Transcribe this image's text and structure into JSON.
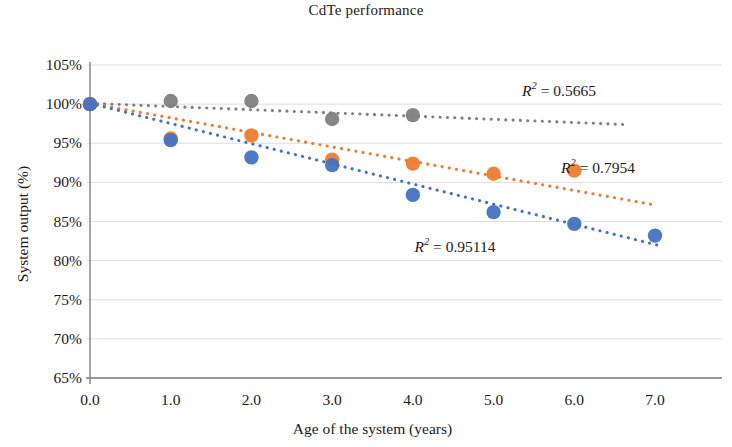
{
  "chart_data": {
    "type": "scatter",
    "title": "CdTe performance",
    "xlabel": "Age of the system (years)",
    "ylabel": "System output (%)",
    "xlim": [
      0.0,
      7.0
    ],
    "ylim": [
      65,
      105
    ],
    "xticks": [
      "0.0",
      "1.0",
      "2.0",
      "3.0",
      "4.0",
      "5.0",
      "6.0",
      "7.0"
    ],
    "xtick_values": [
      0,
      1,
      2,
      3,
      4,
      5,
      6,
      7
    ],
    "yticks": [
      "65%",
      "70%",
      "75%",
      "80%",
      "85%",
      "90%",
      "95%",
      "100%",
      "105%"
    ],
    "ytick_values": [
      65,
      70,
      75,
      80,
      85,
      90,
      95,
      100,
      105
    ],
    "grid": "horizontal",
    "legend": "none",
    "series": [
      {
        "name": "gray-series",
        "color": "#808080",
        "marker": "circle",
        "x": [
          0.0,
          1.0,
          2.0,
          3.0,
          4.0
        ],
        "y": [
          100.0,
          100.4,
          100.4,
          98.1,
          98.6
        ],
        "trendline": {
          "style": "dotted",
          "x_start": 0.0,
          "y_start": 100.1,
          "x_end": 6.6,
          "y_end": 97.4,
          "r2_label": "0.5665"
        }
      },
      {
        "name": "orange-series",
        "color": "#ED7D31",
        "marker": "circle",
        "x": [
          0.0,
          1.0,
          2.0,
          3.0,
          4.0,
          5.0,
          6.0
        ],
        "y": [
          100.0,
          95.6,
          96.0,
          92.9,
          92.4,
          91.1,
          91.5
        ],
        "trendline": {
          "style": "dotted",
          "x_start": 0.0,
          "y_start": 100.1,
          "x_end": 6.95,
          "y_end": 87.2,
          "r2_label": "0.7954"
        }
      },
      {
        "name": "blue-series",
        "color": "#4472C4",
        "marker": "circle",
        "x": [
          0.0,
          1.0,
          2.0,
          3.0,
          4.0,
          5.0,
          6.0,
          7.0
        ],
        "y": [
          100.0,
          95.4,
          93.2,
          92.2,
          88.4,
          86.2,
          84.7,
          83.2
        ],
        "trendline": {
          "style": "dotted",
          "x_start": 0.0,
          "y_start": 100.1,
          "x_end": 7.1,
          "y_end": 81.8,
          "r2_label": "0.95114"
        }
      }
    ],
    "annotations": [
      {
        "name": "r2-gray",
        "text_prefix": "R",
        "text_suffix": "= 0.5665",
        "exponent": "2",
        "x_px": 559,
        "y_px": 90,
        "color": "#1b1b1b"
      },
      {
        "name": "r2-orange",
        "text_prefix": "R",
        "text_suffix": "= 0.7954",
        "exponent": "2",
        "x_px": 598,
        "y_px": 167,
        "color": "#1b1b1b"
      },
      {
        "name": "r2-blue",
        "text_prefix": "R",
        "text_suffix": "= 0.95114",
        "exponent": "2",
        "x_px": 455,
        "y_px": 246,
        "color": "#1b1b1b"
      }
    ]
  },
  "colors": {
    "gray": "#808080",
    "orange": "#ED7D31",
    "blue": "#4472C4",
    "grid": "#d9d9d9",
    "axis": "#7f7f7f",
    "text": "#1b1b1b",
    "background": "#ffffff"
  }
}
